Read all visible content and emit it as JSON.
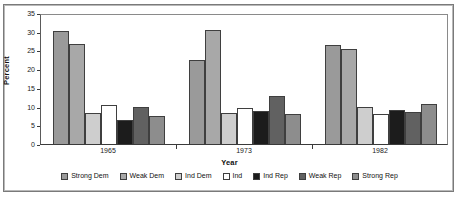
{
  "chart_data": {
    "type": "bar",
    "title": "",
    "xlabel": "Year",
    "ylabel": "Percent",
    "categories": [
      "1965",
      "1973",
      "1982"
    ],
    "ylim": [
      0,
      35
    ],
    "yticks": [
      0,
      5,
      10,
      15,
      20,
      25,
      30,
      35
    ],
    "ytick_labels": [
      "0",
      "5",
      "10",
      "15",
      "20",
      "25",
      "30",
      "35"
    ],
    "grid": false,
    "legend_position": "bottom",
    "series": [
      {
        "name": "Strong Dem",
        "color": "#9a9a9a",
        "values": [
          30.3,
          22.4,
          26.5
        ]
      },
      {
        "name": "Weak Dem",
        "color": "#a8a8a8",
        "values": [
          26.7,
          30.4,
          25.4
        ]
      },
      {
        "name": "Ind Dem",
        "color": "#cecece",
        "values": [
          8.2,
          8.2,
          9.8
        ]
      },
      {
        "name": "Ind",
        "color": "#ffffff",
        "values": [
          10.5,
          9.5,
          8.0
        ]
      },
      {
        "name": "Ind Rep",
        "color": "#1c1c1c",
        "values": [
          6.4,
          8.8,
          9.2
        ]
      },
      {
        "name": "Weak Rep",
        "color": "#616161",
        "values": [
          10.0,
          12.9,
          8.5
        ]
      },
      {
        "name": "Strong Rep",
        "color": "#8d8d8d",
        "values": [
          7.6,
          8.1,
          10.8
        ]
      }
    ]
  },
  "axis": {
    "y_label": "Percent",
    "x_label": "Year"
  },
  "legend": {
    "items": [
      {
        "label": "Strong Dem"
      },
      {
        "label": "Weak Dem"
      },
      {
        "label": "Ind Dem"
      },
      {
        "label": "Ind"
      },
      {
        "label": "Ind Rep"
      },
      {
        "label": "Weak Rep"
      },
      {
        "label": "Strong Rep"
      }
    ]
  }
}
